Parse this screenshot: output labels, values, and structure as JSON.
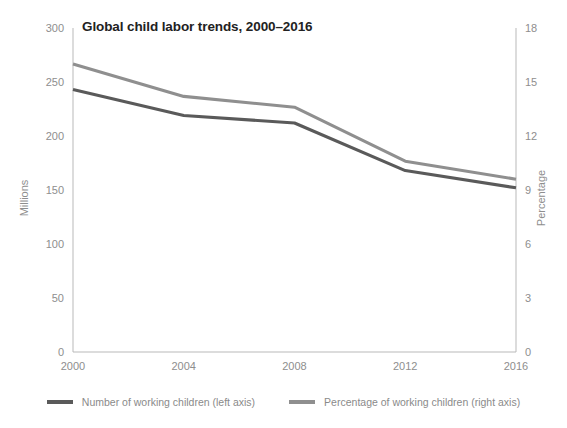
{
  "chart_data": {
    "type": "line",
    "title": "Global child labor trends, 2000–2016",
    "xlabel": "",
    "ylabel": "Millions",
    "y2label": "Percentage",
    "x": [
      2000,
      2004,
      2008,
      2012,
      2016
    ],
    "xtick_labels": [
      "2000",
      "2004",
      "2008",
      "2012",
      "2016"
    ],
    "xlim": [
      2000,
      2016
    ],
    "ylim": [
      0,
      300
    ],
    "ytick_labels": [
      "0",
      "50",
      "100",
      "150",
      "200",
      "250",
      "300"
    ],
    "yticks": [
      0,
      50,
      100,
      150,
      200,
      250,
      300
    ],
    "y2lim": [
      0,
      18
    ],
    "y2tick_labels": [
      "0",
      "3",
      "6",
      "9",
      "12",
      "15",
      "18"
    ],
    "y2ticks": [
      0,
      3,
      6,
      9,
      12,
      15,
      18
    ],
    "grid": false,
    "legend_position": "bottom",
    "series": [
      {
        "name": "Number of working children (left axis)",
        "axis": "left",
        "color": "#5a5a5a",
        "values": [
          243,
          219,
          212,
          168,
          152
        ]
      },
      {
        "name": "Percentage of working children (right axis)",
        "axis": "right",
        "color": "#8f8f8f",
        "values": [
          16.0,
          14.2,
          13.6,
          10.6,
          9.6
        ]
      }
    ]
  },
  "legend": {
    "items": [
      {
        "label": "Number of working children (left axis)",
        "color": "#5a5a5a"
      },
      {
        "label": "Percentage of working children (right axis)",
        "color": "#8f8f8f"
      }
    ]
  },
  "colors": {
    "axis": "#b9b9b9",
    "tick_text": "#8e8e8e",
    "title_text": "#222222",
    "series_dark": "#5a5a5a",
    "series_light": "#8f8f8f",
    "background": "#ffffff"
  }
}
